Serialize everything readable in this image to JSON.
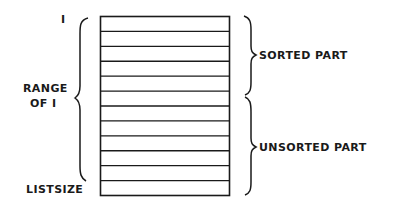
{
  "diagram": {
    "labels": {
      "index_start": "I",
      "range_line1": "RANGE",
      "range_line2": "OF I",
      "index_end": "LISTSIZE",
      "sorted": "SORTED PART",
      "unsorted": "UNSORTED PART"
    },
    "list": {
      "rows": 12,
      "sorted_rows": 5,
      "unsorted_rows": 7
    },
    "colors": {
      "ink": "#1a1a1a",
      "background": "#ffffff"
    }
  }
}
